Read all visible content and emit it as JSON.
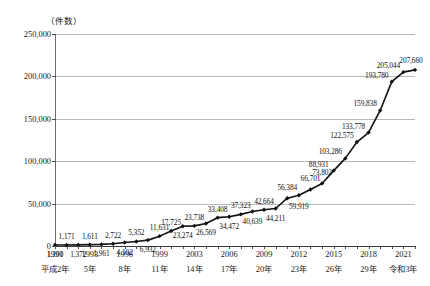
{
  "chart_data": {
    "type": "line",
    "title": "",
    "unit_label": "（件数）",
    "xlabel": "",
    "ylabel": "",
    "ylim": [
      0,
      250000
    ],
    "yticks": [
      0,
      50000,
      100000,
      150000,
      200000,
      250000
    ],
    "ytick_labels": [
      "0",
      "50,000",
      "100,000",
      "150,000",
      "200,000",
      "250,000"
    ],
    "grid": true,
    "legend": "none",
    "x": [
      1990,
      1991,
      1992,
      1993,
      1994,
      1995,
      1996,
      1997,
      1998,
      1999,
      2000,
      2001,
      2002,
      2003,
      2004,
      2005,
      2006,
      2007,
      2008,
      2009,
      2010,
      2011,
      2012,
      2013,
      2014,
      2015,
      2016,
      2017,
      2018,
      2019,
      2020,
      2021
    ],
    "values": [
      1101,
      1171,
      1372,
      1611,
      1961,
      2722,
      4102,
      5352,
      6932,
      11631,
      17725,
      23274,
      23738,
      26569,
      33408,
      34472,
      37323,
      40639,
      42664,
      44211,
      56384,
      59919,
      66701,
      73802,
      88931,
      103286,
      122575,
      133778,
      159838,
      193780,
      205044,
      207660
    ],
    "point_labels": [
      "1,101",
      "1,171",
      "1,372",
      "1,611",
      "1,961",
      "2,722",
      "4,102",
      "5,352",
      "6,932",
      "11,631",
      "17,725",
      "23,274",
      "23,738",
      "26,569",
      "33,408",
      "34,472",
      "37,323",
      "40,639",
      "42,664",
      "44,211",
      "56,384",
      "59,919",
      "66,701",
      "73,802",
      "88,931",
      "103,286",
      "122,575",
      "133,778",
      "159,838",
      "193,780",
      "205,044",
      "207,660"
    ],
    "label_positions": [
      "below",
      "above",
      "below",
      "above",
      "below",
      "above",
      "below",
      "above",
      "below",
      "above",
      "above",
      "below",
      "above",
      "below",
      "above",
      "below",
      "above",
      "below",
      "above",
      "below",
      "above",
      "below",
      "above",
      "above",
      "above",
      "above",
      "above",
      "above",
      "above",
      "above",
      "above",
      "above"
    ],
    "xtick_years": [
      "1990",
      "1993",
      "1996",
      "1999",
      "2003",
      "2006",
      "2009",
      "2012",
      "2015",
      "2018",
      "2021"
    ],
    "xtick_eras": [
      "平成2年",
      "5年",
      "8年",
      "11年",
      "14年",
      "17年",
      "20年",
      "23年",
      "26年",
      "29年",
      "令和3年"
    ],
    "xtick_x": [
      1990,
      1993,
      1996,
      1999,
      2002,
      2005,
      2008,
      2011,
      2014,
      2017,
      2020
    ],
    "series_color": "#111111",
    "grid_color": "#b9b9b9",
    "marker": "diamond"
  }
}
